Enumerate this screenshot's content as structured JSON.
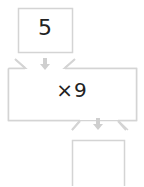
{
  "diagram": {
    "input_box": {
      "value": "5"
    },
    "machine": {
      "operation": "×9"
    },
    "output_box": {
      "value": ""
    },
    "colors": {
      "border": "#d4d4d4",
      "arrow": "#cfcfcf",
      "text": "#222222"
    }
  }
}
